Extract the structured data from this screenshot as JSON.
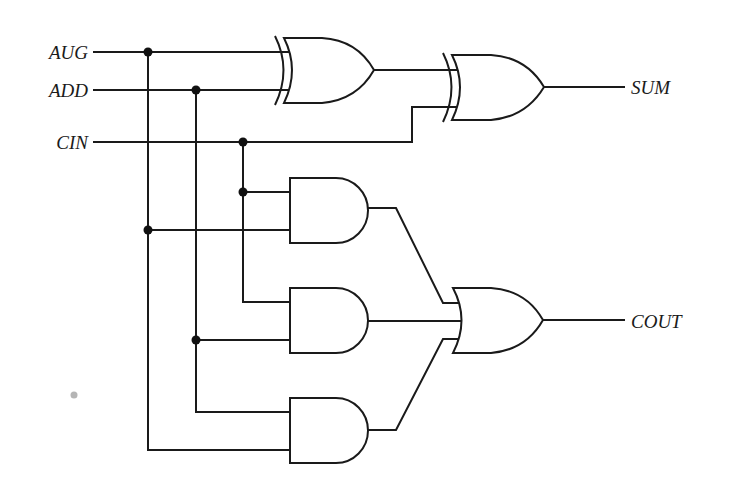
{
  "diagram": {
    "title": "",
    "type": "full-adder-logic-circuit",
    "inputs": [
      {
        "id": "aug",
        "label": "AUG"
      },
      {
        "id": "add",
        "label": "ADD"
      },
      {
        "id": "cin",
        "label": "CIN"
      }
    ],
    "outputs": [
      {
        "id": "sum",
        "label": "SUM"
      },
      {
        "id": "cout",
        "label": "COUT"
      }
    ],
    "gates": [
      {
        "id": "xor1",
        "type": "XOR",
        "inputs": [
          "AUG",
          "ADD"
        ]
      },
      {
        "id": "xor2",
        "type": "XOR",
        "inputs": [
          "xor1",
          "CIN"
        ],
        "output": "SUM"
      },
      {
        "id": "and1",
        "type": "AND",
        "inputs": [
          "CIN",
          "AUG"
        ]
      },
      {
        "id": "and2",
        "type": "AND",
        "inputs": [
          "CIN",
          "ADD"
        ]
      },
      {
        "id": "and3",
        "type": "AND",
        "inputs": [
          "ADD",
          "AUG"
        ]
      },
      {
        "id": "or1",
        "type": "OR",
        "inputs": [
          "and1",
          "and2",
          "and3"
        ],
        "output": "COUT"
      }
    ],
    "colors": {
      "line": "#1a1a1a",
      "background": "#ffffff"
    }
  }
}
